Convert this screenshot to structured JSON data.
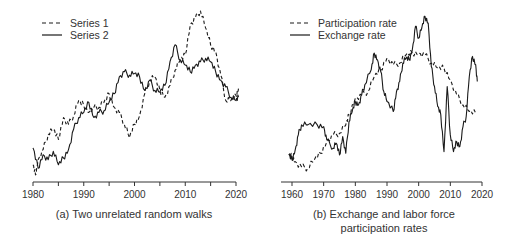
{
  "chart_data": [
    {
      "type": "line",
      "panel": "a",
      "title": "(a) Two unrelated random walks",
      "xlabel": "",
      "ylabel": "",
      "xlim": [
        1980,
        2020
      ],
      "x_ticks": [
        1980,
        1990,
        2000,
        2010,
        2020
      ],
      "x_minor_ticks": [
        1985,
        1995,
        2005,
        2015
      ],
      "y_axis_shown": false,
      "y_units": "relative level (0 = bottom, 100 = top of plot area)",
      "grid": false,
      "legend_position": "top-left",
      "series": [
        {
          "name": "Series 1",
          "style": "dashed",
          "points": [
            [
              1980,
              9
            ],
            [
              1980.5,
              3
            ],
            [
              1981,
              12
            ],
            [
              1982,
              18
            ],
            [
              1983,
              27
            ],
            [
              1984,
              30
            ],
            [
              1985,
              24
            ],
            [
              1986,
              37
            ],
            [
              1987,
              33
            ],
            [
              1988,
              38
            ],
            [
              1989,
              47
            ],
            [
              1990,
              44
            ],
            [
              1991,
              40
            ],
            [
              1992,
              43
            ],
            [
              1993,
              43
            ],
            [
              1994,
              46
            ],
            [
              1995,
              51
            ],
            [
              1996,
              43
            ],
            [
              1997,
              40
            ],
            [
              1998,
              33
            ],
            [
              1999,
              25
            ],
            [
              2000,
              33
            ],
            [
              2001,
              38
            ],
            [
              2002,
              51
            ],
            [
              2003,
              59
            ],
            [
              2004,
              61
            ],
            [
              2005,
              53
            ],
            [
              2006,
              49
            ],
            [
              2007,
              56
            ],
            [
              2008,
              65
            ],
            [
              2009,
              71
            ],
            [
              2010,
              74
            ],
            [
              2011,
              92
            ],
            [
              2012,
              96
            ],
            [
              2013,
              100
            ],
            [
              2014,
              90
            ],
            [
              2015,
              80
            ],
            [
              2016,
              76
            ],
            [
              2017,
              62
            ],
            [
              2018,
              47
            ],
            [
              2019,
              47
            ],
            [
              2020,
              50
            ],
            [
              2020.5,
              54
            ]
          ]
        },
        {
          "name": "Series 2",
          "style": "solid",
          "points": [
            [
              1980,
              19
            ],
            [
              1981,
              7
            ],
            [
              1982,
              15
            ],
            [
              1983,
              12
            ],
            [
              1984,
              17
            ],
            [
              1985,
              9
            ],
            [
              1986,
              13
            ],
            [
              1987,
              18
            ],
            [
              1988,
              30
            ],
            [
              1989,
              37
            ],
            [
              1990,
              40
            ],
            [
              1991,
              46
            ],
            [
              1992,
              37
            ],
            [
              1993,
              40
            ],
            [
              1994,
              41
            ],
            [
              1995,
              46
            ],
            [
              1996,
              51
            ],
            [
              1997,
              61
            ],
            [
              1998,
              64
            ],
            [
              1999,
              62
            ],
            [
              2000,
              63
            ],
            [
              2001,
              61
            ],
            [
              2002,
              53
            ],
            [
              2003,
              59
            ],
            [
              2004,
              53
            ],
            [
              2005,
              52
            ],
            [
              2006,
              56
            ],
            [
              2007,
              70
            ],
            [
              2008,
              80
            ],
            [
              2009,
              71
            ],
            [
              2010,
              68
            ],
            [
              2011,
              64
            ],
            [
              2012,
              68
            ],
            [
              2013,
              70
            ],
            [
              2014,
              72
            ],
            [
              2015,
              70
            ],
            [
              2016,
              64
            ],
            [
              2017,
              59
            ],
            [
              2018,
              55
            ],
            [
              2019,
              49
            ],
            [
              2020,
              47
            ],
            [
              2020.5,
              49
            ]
          ]
        }
      ]
    },
    {
      "type": "line",
      "panel": "b",
      "title": "(b) Exchange and labor force participation rates",
      "title_lines": [
        "(b) Exchange and labor force",
        "participation rates"
      ],
      "xlabel": "",
      "ylabel": "",
      "xlim": [
        1957,
        2020
      ],
      "x_ticks": [
        1960,
        1970,
        1980,
        1990,
        2000,
        2010,
        2020
      ],
      "y_axis_shown": false,
      "y_units": "relative level (0 = bottom, 100 = top of plot area)",
      "grid": false,
      "legend_position": "top-left",
      "series": [
        {
          "name": "Participation rate",
          "style": "dashed",
          "points": [
            [
              1959,
              12
            ],
            [
              1960,
              11
            ],
            [
              1961,
              8
            ],
            [
              1963,
              5
            ],
            [
              1965,
              4
            ],
            [
              1967,
              9
            ],
            [
              1969,
              13
            ],
            [
              1971,
              20
            ],
            [
              1973,
              24
            ],
            [
              1975,
              25
            ],
            [
              1977,
              30
            ],
            [
              1978,
              36
            ],
            [
              1980,
              46
            ],
            [
              1982,
              48
            ],
            [
              1984,
              50
            ],
            [
              1986,
              59
            ],
            [
              1988,
              63
            ],
            [
              1990,
              70
            ],
            [
              1992,
              66
            ],
            [
              1994,
              67
            ],
            [
              1996,
              72
            ],
            [
              1998,
              73
            ],
            [
              2000,
              73
            ],
            [
              2002,
              72
            ],
            [
              2004,
              67
            ],
            [
              2006,
              64
            ],
            [
              2008,
              64
            ],
            [
              2010,
              57
            ],
            [
              2012,
              48
            ],
            [
              2014,
              42
            ],
            [
              2016,
              38
            ],
            [
              2018,
              37
            ]
          ]
        },
        {
          "name": "Exchange rate",
          "style": "solid",
          "points": [
            [
              1959,
              12
            ],
            [
              1960,
              9
            ],
            [
              1961,
              15
            ],
            [
              1962,
              24
            ],
            [
              1963,
              30
            ],
            [
              1965,
              30
            ],
            [
              1968,
              30
            ],
            [
              1970,
              29
            ],
            [
              1971,
              21
            ],
            [
              1973,
              16
            ],
            [
              1974,
              19
            ],
            [
              1975,
              12
            ],
            [
              1976,
              23
            ],
            [
              1977,
              13
            ],
            [
              1978,
              32
            ],
            [
              1979,
              38
            ],
            [
              1980,
              44
            ],
            [
              1981,
              42
            ],
            [
              1982,
              48
            ],
            [
              1983,
              54
            ],
            [
              1985,
              63
            ],
            [
              1986,
              73
            ],
            [
              1987,
              69
            ],
            [
              1988,
              62
            ],
            [
              1989,
              50
            ],
            [
              1990,
              44
            ],
            [
              1992,
              38
            ],
            [
              1993,
              50
            ],
            [
              1994,
              56
            ],
            [
              1995,
              67
            ],
            [
              1996,
              70
            ],
            [
              1997,
              69
            ],
            [
              1998,
              75
            ],
            [
              1999,
              89
            ],
            [
              2000,
              82
            ],
            [
              2001,
              88
            ],
            [
              2002,
              95
            ],
            [
              2003,
              91
            ],
            [
              2004,
              65
            ],
            [
              2005,
              53
            ],
            [
              2006,
              41
            ],
            [
              2007,
              36
            ],
            [
              2008,
              14
            ],
            [
              2009,
              53
            ],
            [
              2010,
              24
            ],
            [
              2011,
              14
            ],
            [
              2012,
              20
            ],
            [
              2013,
              17
            ],
            [
              2014,
              29
            ],
            [
              2015,
              35
            ],
            [
              2016,
              59
            ],
            [
              2017,
              71
            ],
            [
              2018,
              66
            ],
            [
              2018.5,
              56
            ]
          ]
        }
      ]
    }
  ],
  "panels": {
    "a": {
      "caption": "(a) Two unrelated random walks",
      "tick_labels": [
        "1980",
        "1990",
        "2000",
        "2010",
        "2020"
      ],
      "legend": [
        {
          "label": "Series 1",
          "style": "dashed"
        },
        {
          "label": "Series 2",
          "style": "solid"
        }
      ]
    },
    "b": {
      "caption_line1": "(b) Exchange and labor force",
      "caption_line2": "participation rates",
      "tick_labels": [
        "1960",
        "1970",
        "1980",
        "1990",
        "2000",
        "2010",
        "2020"
      ],
      "legend": [
        {
          "label": "Participation rate",
          "style": "dashed"
        },
        {
          "label": "Exchange rate",
          "style": "solid"
        }
      ]
    }
  },
  "colors": {
    "line": "#1a1a1a",
    "axis": "#333333",
    "text": "#333333",
    "background": "#ffffff"
  }
}
